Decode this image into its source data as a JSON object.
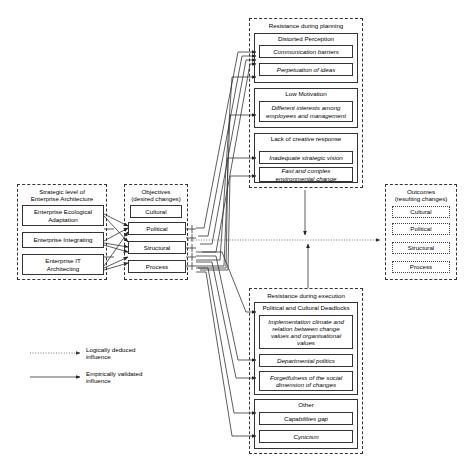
{
  "diagram": {
    "legend": {
      "logical": "Logically deduced\ninfluence",
      "logical_line1": "Logically deduced",
      "logical_line2": "influence",
      "empirical_line1": "Empirically validated",
      "empirical_line2": "influence"
    },
    "strategic": {
      "title_line1": "Strategic level of",
      "title_line2": "Enterprise Architecture",
      "items": [
        {
          "label": "Enterprise Ecological\nAdaptation"
        },
        {
          "label": "Enterprise Integrating"
        },
        {
          "label": "Enterprise IT\nArchitecting"
        }
      ]
    },
    "objectives": {
      "title_line1": "Objectives",
      "title_line2": "(desired changes)",
      "items": [
        {
          "label": "Cultural"
        },
        {
          "label": "Political"
        },
        {
          "label": "Structural"
        },
        {
          "label": "Process"
        }
      ]
    },
    "outcomes": {
      "title_line1": "Outcomes",
      "title_line2": "(resulting changes)",
      "items": [
        {
          "label": "Cultural"
        },
        {
          "label": "Political"
        },
        {
          "label": "Structural"
        },
        {
          "label": "Process"
        }
      ]
    },
    "resistance_planning": {
      "title": "Resistance during planning",
      "categories": [
        {
          "name": "Distorted Perception",
          "items": [
            {
              "label": "Communication barriers"
            },
            {
              "label": "Perpetuation of ideas"
            }
          ]
        },
        {
          "name": "Low Motivation",
          "items": [
            {
              "label": "Different interests among\nemployees and management"
            }
          ]
        },
        {
          "name": "Lack of creative response",
          "items": [
            {
              "label": "Inadequate strategic vision"
            },
            {
              "label": "Fast and complex\nenvironmental change"
            }
          ]
        }
      ]
    },
    "resistance_execution": {
      "title": "Resistance during execution",
      "categories": [
        {
          "name": "Political and Cultural Deadlocks",
          "items": [
            {
              "label": "Implementation climate and\nrelation between change\nvalues and organisational\nvalues"
            },
            {
              "label": "Departmental politics"
            },
            {
              "label": "Forgetfulness of the social\ndimension of changes"
            }
          ]
        },
        {
          "name": "Other",
          "items": [
            {
              "label": "Capabilities gap"
            },
            {
              "label": "Cynicism"
            }
          ]
        }
      ]
    },
    "colors": {
      "stroke": "#333333",
      "background": "#ffffff",
      "text": "#000000"
    }
  }
}
